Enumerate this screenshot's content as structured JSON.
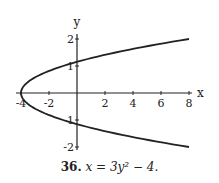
{
  "chart_data": {
    "type": "line",
    "title": "",
    "caption_number": "36.",
    "caption_equation": "x = 3y² − 4.",
    "xlabel": "x",
    "ylabel": "y",
    "xlim": [
      -4.2,
      8.3
    ],
    "ylim": [
      -2.1,
      2.2
    ],
    "x_ticks": [
      -4,
      -2,
      2,
      4,
      6,
      8
    ],
    "x_tick_labels": [
      "-4",
      "-2",
      "2",
      "4",
      "6",
      "8"
    ],
    "y_ticks": [
      2,
      1,
      -1,
      -2
    ],
    "y_tick_labels": [
      "2",
      "1",
      "-1",
      "-2"
    ],
    "grid": false,
    "legend": null,
    "series": [
      {
        "name": "x = 3y^2 - 4",
        "y": [
          -2,
          -1.5,
          -1,
          -0.5,
          0,
          0.5,
          1,
          1.5,
          2
        ],
        "x": [
          8,
          2.75,
          -1,
          -3.25,
          -4,
          -3.25,
          -1,
          2.75,
          8
        ]
      }
    ],
    "marked_points": [
      {
        "x": 0,
        "y": 1.15
      },
      {
        "x": 0,
        "y": -1.15
      },
      {
        "x": -4,
        "y": 0
      }
    ]
  }
}
